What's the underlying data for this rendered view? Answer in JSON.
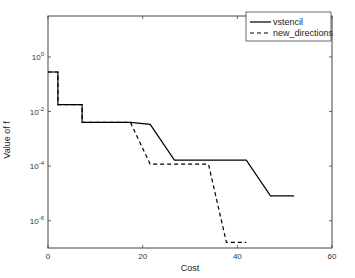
{
  "chart_data": {
    "type": "line",
    "title": "",
    "xlabel": "Cost",
    "ylabel": "Value of f",
    "xscale": "linear",
    "yscale": "log",
    "xlim": [
      0,
      60
    ],
    "ylim_exponent": [
      -7,
      1.5
    ],
    "xticks": [
      0,
      20,
      40,
      60
    ],
    "xtick_labels": [
      "0",
      "20",
      "40",
      "60"
    ],
    "yticks_exponent": [
      0,
      -2,
      -4,
      -6
    ],
    "ytick_labels": [
      {
        "base": "10",
        "exp": "0"
      },
      {
        "base": "10",
        "exp": "-2"
      },
      {
        "base": "10",
        "exp": "-4"
      },
      {
        "base": "10",
        "exp": "-6"
      }
    ],
    "grid": false,
    "legend_position": "top-right",
    "series": [
      {
        "name": "vstencil",
        "style": "solid",
        "color": "#000000",
        "points": [
          [
            0,
            0.28
          ],
          [
            2.1,
            0.28
          ],
          [
            2.1,
            0.018
          ],
          [
            7.2,
            0.018
          ],
          [
            7.2,
            0.004
          ],
          [
            17.4,
            0.004
          ],
          [
            21.6,
            0.0034
          ],
          [
            26.7,
            0.000166
          ],
          [
            41.9,
            0.000166
          ],
          [
            47.0,
            8.1e-06
          ],
          [
            52.0,
            8.1e-06
          ]
        ]
      },
      {
        "name": "new_directions",
        "style": "dashed",
        "color": "#000000",
        "points": [
          [
            0,
            0.28
          ],
          [
            2.1,
            0.28
          ],
          [
            2.1,
            0.018
          ],
          [
            7.2,
            0.018
          ],
          [
            7.2,
            0.004
          ],
          [
            17.4,
            0.004
          ],
          [
            21.6,
            0.000118
          ],
          [
            33.9,
            0.000118
          ],
          [
            37.7,
            1.6e-07
          ],
          [
            41.9,
            1.6e-07
          ]
        ]
      }
    ]
  }
}
